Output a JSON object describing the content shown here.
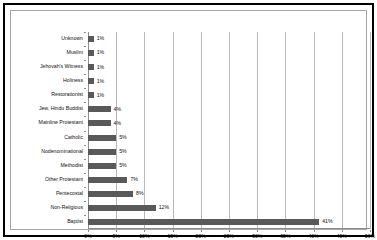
{
  "chart_data": {
    "type": "bar",
    "orientation": "horizontal",
    "title": "",
    "xlabel": "",
    "ylabel": "",
    "xlim": [
      0,
      50
    ],
    "xticks": [
      "0%",
      "5%",
      "10%",
      "15%",
      "20%",
      "25%",
      "30%",
      "35%",
      "40%",
      "45%",
      "50%"
    ],
    "xtick_values": [
      0,
      5,
      10,
      15,
      20,
      25,
      30,
      35,
      40,
      45,
      50
    ],
    "grid": true,
    "legend": false,
    "bar_color": "#595959",
    "categories": [
      "Unknown",
      "Muslim",
      "Jehovah's Witness",
      "Holiness",
      "Restorationist",
      "Jew, Hindu Buddist",
      "Mainline Protestant",
      "Catholic",
      "Nodenominational",
      "Methodist",
      "Other Protestant",
      "Pentecostal",
      "Non-Religious",
      "Baptist"
    ],
    "values": [
      1,
      1,
      1,
      1,
      1,
      4,
      4,
      5,
      5,
      5,
      7,
      8,
      12,
      41
    ],
    "data_labels": [
      "1%",
      "1%",
      "1%",
      "1%",
      "1%",
      "4%",
      "4%",
      "5%",
      "5%",
      "5%",
      "7%",
      "8%",
      "12%",
      "41%"
    ]
  },
  "colors": {
    "bar": "#595959",
    "gridline": "#b8b8b8",
    "axis": "#8c8c8c",
    "frame": "#000000",
    "text": "#111111",
    "background": "#ffffff"
  }
}
